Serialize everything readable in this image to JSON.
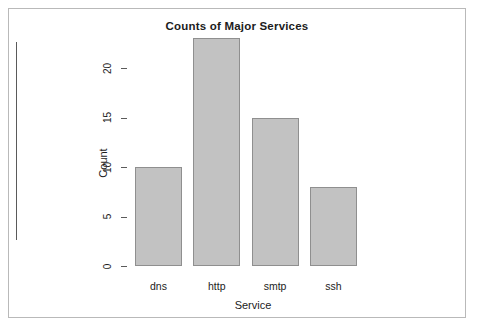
{
  "figure": {
    "background_color": "#ffffff",
    "frame_color": "#b9b9b9"
  },
  "chart_data": {
    "type": "bar",
    "title": "Counts of Major Services",
    "xlabel": "Service",
    "ylabel": "Count",
    "categories": [
      "dns",
      "http",
      "smtp",
      "ssh"
    ],
    "values": [
      10,
      23,
      15,
      8
    ],
    "ylim": [
      0,
      23
    ],
    "yticks": [
      0,
      5,
      10,
      15,
      20
    ],
    "ytick_labels": [
      "0",
      "5",
      "10",
      "15",
      "20"
    ],
    "grid": false,
    "legend": null,
    "bar_color": "#c2c2c2",
    "bar_border_color": "#8f8f8f",
    "axis_color": "#5a5a5a",
    "text_color": "#1c1c1c"
  }
}
